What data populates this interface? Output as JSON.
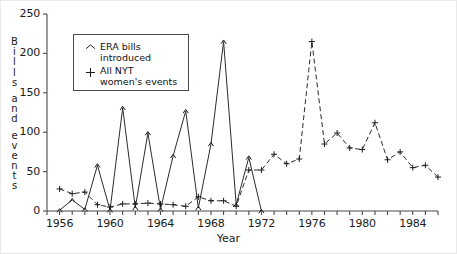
{
  "chart_data": {
    "type": "line",
    "title": "",
    "xlabel": "Year",
    "ylabel": "Bills and events",
    "ylabel_letters": [
      "B",
      "i",
      "l",
      "l",
      "s",
      "",
      "a",
      "n",
      "d",
      "",
      "e",
      "v",
      "e",
      "n",
      "t",
      "s"
    ],
    "xlim": [
      1955,
      1986
    ],
    "ylim": [
      0,
      250
    ],
    "xticks": [
      1955,
      1956,
      1957,
      1958,
      1959,
      1960,
      1961,
      1962,
      1963,
      1964,
      1965,
      1966,
      1967,
      1968,
      1969,
      1970,
      1971,
      1972,
      1973,
      1974,
      1975,
      1976,
      1977,
      1978,
      1979,
      1980,
      1981,
      1982,
      1983,
      1984,
      1985,
      1986
    ],
    "xtick_labels": [
      {
        "value": 1956,
        "label": "1956"
      },
      {
        "value": 1960,
        "label": "1960"
      },
      {
        "value": 1964,
        "label": "1964"
      },
      {
        "value": 1968,
        "label": "1968"
      },
      {
        "value": 1972,
        "label": "1972"
      },
      {
        "value": 1976,
        "label": "1976"
      },
      {
        "value": 1980,
        "label": "1980"
      },
      {
        "value": 1984,
        "label": "1984"
      }
    ],
    "yticks": [
      0,
      50,
      100,
      150,
      200,
      250
    ],
    "ytick_labels": [
      "0",
      "50",
      "100",
      "150",
      "200",
      "250"
    ],
    "grid": false,
    "legend_position": "upper-left-inside",
    "series": [
      {
        "name": "ERA bills introduced",
        "marker": "triangle",
        "linestyle": "solid",
        "color": "#2b2b2b",
        "x": [
          1956,
          1957,
          1958,
          1959,
          1960,
          1961,
          1962,
          1963,
          1964,
          1965,
          1966,
          1967,
          1968,
          1969,
          1970,
          1971,
          1972
        ],
        "values": [
          1,
          14,
          2,
          58,
          1,
          131,
          4,
          99,
          2,
          70,
          127,
          4,
          85,
          215,
          8,
          68,
          0
        ]
      },
      {
        "name": "All NYT women's events",
        "marker": "plus",
        "linestyle": "dashed",
        "color": "#2b2b2b",
        "x": [
          1956,
          1957,
          1958,
          1959,
          1960,
          1961,
          1962,
          1963,
          1964,
          1965,
          1966,
          1967,
          1968,
          1969,
          1970,
          1971,
          1972,
          1973,
          1974,
          1975,
          1976,
          1977,
          1978,
          1979,
          1980,
          1981,
          1982,
          1983,
          1984,
          1985,
          1986
        ],
        "values": [
          28,
          22,
          24,
          8,
          5,
          9,
          9,
          10,
          9,
          8,
          6,
          18,
          13,
          13,
          6,
          52,
          52,
          72,
          60,
          66,
          215,
          85,
          99,
          80,
          78,
          112,
          65,
          75,
          55,
          58,
          43
        ]
      }
    ]
  },
  "legend": {
    "entries": [
      {
        "symbol": "triangle-marker",
        "line1": "ERA bills",
        "line2": "introduced"
      },
      {
        "symbol": "plus-marker",
        "line1": "All NYT",
        "line2": "women's events"
      }
    ]
  },
  "colors": {
    "axis": "#4a4a4a",
    "series": "#2b2b2b",
    "background": "#ffffff"
  }
}
